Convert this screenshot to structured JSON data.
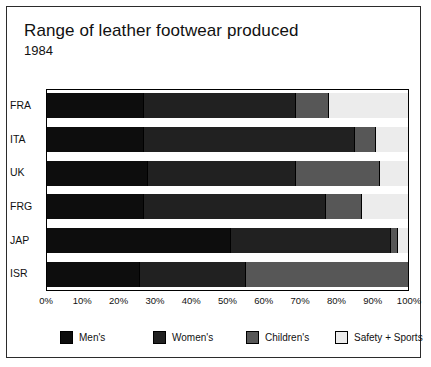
{
  "chart_data": {
    "type": "bar",
    "orientation": "horizontal",
    "stacked": true,
    "normalized": "percent",
    "title": "Range of leather footwear produced",
    "subtitle": "1984",
    "xlabel": "",
    "ylabel": "",
    "xlim": [
      0,
      100
    ],
    "grid": false,
    "legend_position": "bottom",
    "categories": [
      "FRA",
      "ITA",
      "UK",
      "FRG",
      "JAP",
      "ISR"
    ],
    "xticks": [
      "0%",
      "10%",
      "20%",
      "30%",
      "40%",
      "50%",
      "60%",
      "70%",
      "80%",
      "90%",
      "100%"
    ],
    "xtick_values": [
      0,
      10,
      20,
      30,
      40,
      50,
      60,
      70,
      80,
      90,
      100
    ],
    "series": [
      {
        "name": "Men's",
        "color": "#0d0d0d",
        "values": [
          27,
          27,
          28,
          27,
          51,
          26
        ]
      },
      {
        "name": "Women's",
        "color": "#212121",
        "values": [
          42,
          58,
          41,
          50,
          44,
          29
        ]
      },
      {
        "name": "Children's",
        "color": "#575757",
        "values": [
          9,
          6,
          23,
          10,
          2,
          45
        ]
      },
      {
        "name": "Safety + Sports",
        "color": "#ececec",
        "values": [
          22,
          9,
          8,
          13,
          3,
          0
        ]
      }
    ]
  },
  "legend": {
    "items": [
      {
        "label": "Men's"
      },
      {
        "label": "Women's"
      },
      {
        "label": "Children's"
      },
      {
        "label": "Safety + Sports"
      }
    ]
  }
}
